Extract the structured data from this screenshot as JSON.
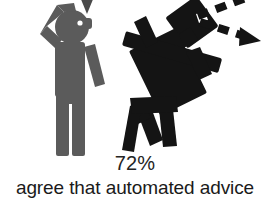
{
  "illustration": {
    "background_color": "#ffffff",
    "human_figure": {
      "name": "confused person pictogram",
      "color": "#5b5b5b",
      "pose": "standing upright, right hand raised to head",
      "eye_color": "#ffffff"
    },
    "robot_figure": {
      "name": "automated advice robot pictogram",
      "color": "#141414",
      "pose": "tilted, falling forward with bent legs",
      "eye_color": "#ffffff"
    },
    "speech_bubble_tail": {
      "name": "speech bubble tail",
      "color": "#3f3f3f"
    },
    "motion_arrows": {
      "name": "dashed motion arrows",
      "color": "#141414",
      "count": 2
    }
  },
  "caption": {
    "stat_value": "72%",
    "stat_description": "agree that automated advice"
  }
}
